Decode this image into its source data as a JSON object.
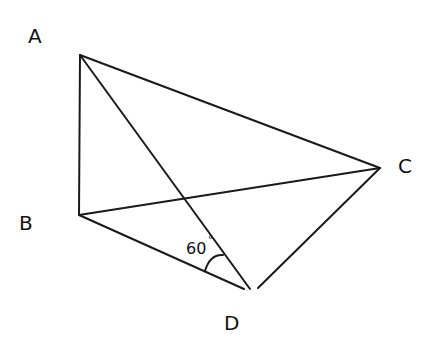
{
  "diagram": {
    "type": "geometry",
    "points": {
      "A": {
        "label": "A",
        "x": 80,
        "y": 55
      },
      "B": {
        "label": "B",
        "x": 79,
        "y": 215
      },
      "C": {
        "label": "C",
        "x": 380,
        "y": 168
      },
      "D": {
        "label": "D",
        "x": 250,
        "y": 289
      }
    },
    "segments": [
      "AB",
      "AC",
      "AD",
      "BC",
      "BD",
      "CD"
    ],
    "angle": {
      "vertex": "D",
      "between": [
        "DB",
        "DA"
      ],
      "value": "60",
      "unit": "°"
    },
    "stroke_color": "#1a1a1a"
  }
}
